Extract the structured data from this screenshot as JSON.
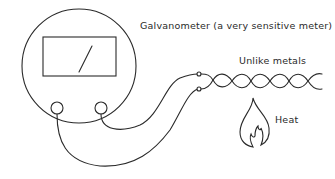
{
  "diagram": {
    "labels": {
      "galvanometer": "Galvanometer (a very sensitive meter)",
      "metals": "Unlike metals",
      "heat": "Heat"
    },
    "components": [
      {
        "id": "galvanometer",
        "shape": "circle",
        "contains": [
          "display-window",
          "needle",
          "terminal-left",
          "terminal-right"
        ]
      },
      {
        "id": "wires",
        "shape": "curve",
        "connects": [
          "terminal-left",
          "terminal-right",
          "junction-top",
          "junction-bottom"
        ]
      },
      {
        "id": "twisted-metals",
        "shape": "twisted-pair",
        "twists": 6
      },
      {
        "id": "flame",
        "shape": "flame",
        "label": "Heat"
      }
    ],
    "colors": {
      "stroke": "#2a2a2a",
      "background": "#ffffff"
    }
  }
}
